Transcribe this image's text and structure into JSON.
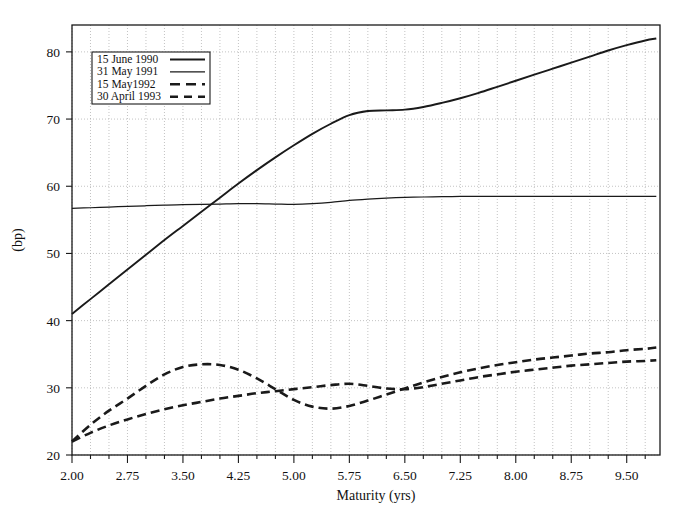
{
  "chart_data": {
    "type": "line",
    "title": "",
    "xlabel": "Maturity (yrs)",
    "ylabel": "(bp)",
    "xlim": [
      2.0,
      9.95
    ],
    "ylim": [
      20,
      84
    ],
    "grid": true,
    "legend_position": "top-left",
    "xticks": [
      "2.00",
      "2.75",
      "3.50",
      "4.25",
      "5.00",
      "5.75",
      "6.50",
      "7.25",
      "8.00",
      "8.75",
      "9.50"
    ],
    "xtick_values": [
      2.0,
      2.75,
      3.5,
      4.25,
      5.0,
      5.75,
      6.5,
      7.25,
      8.0,
      8.75,
      9.5
    ],
    "xtick_minor_step": 0.25,
    "yticks": [
      "20",
      "30",
      "40",
      "50",
      "60",
      "70",
      "80"
    ],
    "ytick_values": [
      20,
      30,
      40,
      50,
      60,
      70,
      80
    ],
    "x": [
      2.0,
      2.25,
      2.5,
      2.75,
      3.0,
      3.25,
      3.5,
      3.75,
      4.0,
      4.25,
      4.5,
      4.75,
      5.0,
      5.25,
      5.5,
      5.75,
      6.0,
      6.25,
      6.5,
      6.75,
      7.0,
      7.25,
      7.5,
      7.75,
      8.0,
      8.25,
      8.5,
      8.75,
      9.0,
      9.25,
      9.5,
      9.75,
      9.9
    ],
    "series": [
      {
        "name": "15 June 1990",
        "style": "solid",
        "color": "#1a1a1a",
        "values": [
          41.0,
          43.2,
          45.4,
          47.6,
          49.8,
          52.0,
          54.1,
          56.2,
          58.3,
          60.4,
          62.4,
          64.3,
          66.1,
          67.8,
          69.3,
          70.6,
          71.2,
          71.3,
          71.4,
          71.8,
          72.4,
          73.1,
          73.9,
          74.8,
          75.7,
          76.6,
          77.5,
          78.4,
          79.3,
          80.2,
          81.0,
          81.7,
          82.0
        ]
      },
      {
        "name": "31 May 1991",
        "style": "solid-thin",
        "color": "#1a1a1a",
        "values": [
          56.7,
          56.8,
          56.9,
          57.0,
          57.1,
          57.2,
          57.25,
          57.3,
          57.35,
          57.4,
          57.4,
          57.35,
          57.3,
          57.4,
          57.6,
          57.9,
          58.1,
          58.25,
          58.35,
          58.4,
          58.45,
          58.5,
          58.5,
          58.5,
          58.5,
          58.5,
          58.5,
          58.5,
          58.5,
          58.5,
          58.5,
          58.5,
          58.5
        ]
      },
      {
        "name": "15 May1992",
        "style": "dashed",
        "color": "#1a1a1a",
        "values": [
          22.0,
          24.5,
          26.6,
          28.4,
          30.3,
          32.0,
          33.1,
          33.5,
          33.4,
          32.7,
          31.4,
          29.8,
          28.2,
          27.2,
          26.9,
          27.3,
          28.1,
          29.0,
          29.9,
          30.8,
          31.6,
          32.3,
          32.9,
          33.4,
          33.8,
          34.2,
          34.5,
          34.8,
          35.1,
          35.3,
          35.6,
          35.8,
          36.0
        ]
      },
      {
        "name": "30 April 1993",
        "style": "dashed",
        "color": "#1a1a1a",
        "values": [
          22.0,
          23.3,
          24.4,
          25.3,
          26.1,
          26.8,
          27.4,
          27.9,
          28.4,
          28.8,
          29.2,
          29.5,
          29.8,
          30.1,
          30.4,
          30.6,
          30.3,
          29.9,
          29.8,
          30.1,
          30.6,
          31.1,
          31.6,
          32.0,
          32.4,
          32.7,
          33.0,
          33.3,
          33.5,
          33.7,
          33.9,
          34.0,
          34.1
        ]
      }
    ]
  },
  "legend": {
    "items": [
      {
        "label": "15 June 1990"
      },
      {
        "label": "31 May 1991"
      },
      {
        "label": "15 May1992"
      },
      {
        "label": "30 April 1993"
      }
    ]
  }
}
